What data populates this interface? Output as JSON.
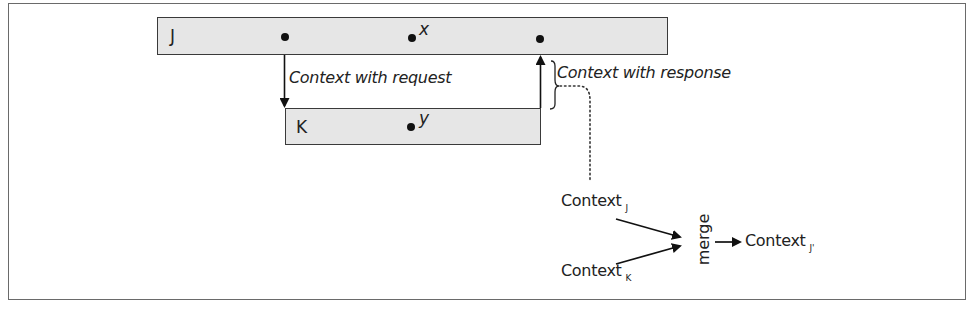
{
  "diagram": {
    "process_j": {
      "label": "J",
      "variable": "x"
    },
    "process_k": {
      "label": "K",
      "variable": "y"
    },
    "arrows": {
      "request_label": "Context with request",
      "response_label": "Context with response"
    },
    "merge": {
      "input_j": {
        "text": "Context",
        "subscript": "J"
      },
      "input_k": {
        "text": "Context",
        "subscript": "K"
      },
      "operation": "merge",
      "output": {
        "text": "Context",
        "subscript": "J'"
      }
    },
    "colors": {
      "box_fill": "#e6e6e6",
      "box_border": "#3a3a3a",
      "frame_border": "#6a6a6a",
      "ink": "#1a1a1a"
    }
  }
}
